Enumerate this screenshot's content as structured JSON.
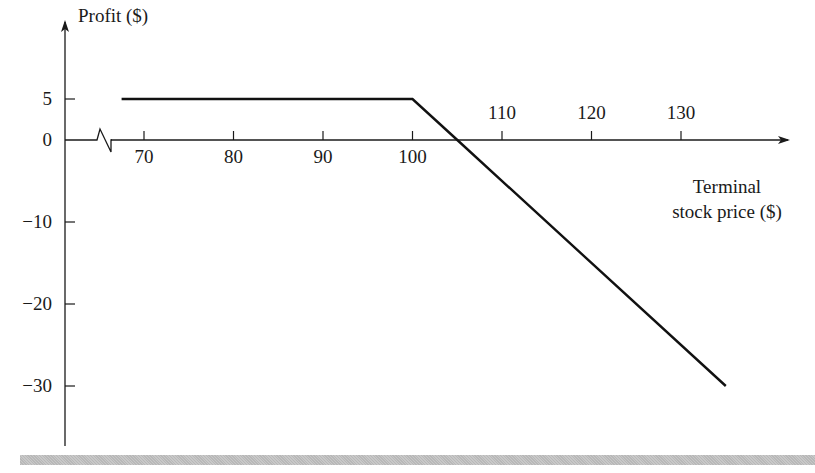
{
  "chart_data": {
    "type": "line",
    "title": "",
    "xlabel": "Terminal stock price ($)",
    "xlabel_lines": [
      "Terminal",
      "stock price ($)"
    ],
    "ylabel": "Profit ($)",
    "x_ticks": [
      70,
      80,
      90,
      100,
      110,
      120,
      130
    ],
    "y_ticks": [
      5,
      0,
      -10,
      -20,
      -30
    ],
    "x_tick_labels": [
      "70",
      "80",
      "90",
      "100",
      "110",
      "120",
      "130"
    ],
    "y_tick_labels": [
      "5",
      "0",
      "−10",
      "−20",
      "−30"
    ],
    "xlim": [
      62.5,
      137
    ],
    "ylim": [
      -37,
      9
    ],
    "axis_break": "x-axis break symbol between origin and 70",
    "grid": false,
    "legend": null,
    "series": [
      {
        "name": "Profit",
        "x": [
          67.5,
          100,
          105,
          135
        ],
        "y": [
          5,
          5,
          0,
          -30
        ]
      }
    ]
  }
}
